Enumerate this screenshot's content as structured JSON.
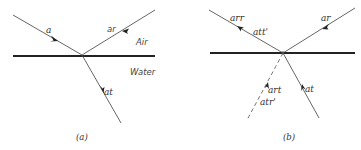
{
  "panels": [
    {
      "id": "a",
      "caption": "(a)",
      "media": {
        "upper": "Air",
        "lower": "Water"
      },
      "interface": {
        "x1": 13,
        "y1": 56,
        "x2": 155,
        "y2": 56
      },
      "intersection": {
        "x": 82,
        "y": 55
      },
      "rays": [
        {
          "label": "a",
          "role": "incident",
          "x1": 13,
          "y1": 15,
          "x2": 82,
          "y2": 55,
          "dashed": false,
          "arrow_toward": "intersection"
        },
        {
          "label": "ar",
          "role": "reflected",
          "x1": 82,
          "y1": 55,
          "x2": 155,
          "y2": 10,
          "dashed": false,
          "arrow_toward": "outward"
        },
        {
          "label": "at",
          "role": "transmitted",
          "x1": 82,
          "y1": 55,
          "x2": 121,
          "y2": 123,
          "dashed": false,
          "arrow_toward": "outward"
        }
      ]
    },
    {
      "id": "b",
      "caption": "(b)",
      "interface": {
        "x1": 210,
        "y1": 53,
        "x2": 355,
        "y2": 53
      },
      "intersection": {
        "x": 283,
        "y": 53
      },
      "rays": [
        {
          "label": "arr",
          "label2": "att'",
          "role": "combined-outgoing",
          "x1": 283,
          "y1": 53,
          "x2": 209,
          "y2": 10,
          "dashed": false,
          "arrow_toward": "outward"
        },
        {
          "label": "ar",
          "role": "reversed-reflected",
          "x1": 355,
          "y1": 8,
          "x2": 283,
          "y2": 53,
          "dashed": false,
          "arrow_toward": "intersection"
        },
        {
          "label": "at",
          "role": "reversed-transmitted",
          "x1": 319,
          "y1": 118,
          "x2": 283,
          "y2": 53,
          "dashed": false,
          "arrow_toward": "intersection"
        },
        {
          "label": "art",
          "label2": "atr'",
          "role": "cancelling",
          "x1": 283,
          "y1": 53,
          "x2": 247,
          "y2": 120,
          "dashed": true,
          "arrow_toward": "intersection"
        }
      ]
    }
  ]
}
